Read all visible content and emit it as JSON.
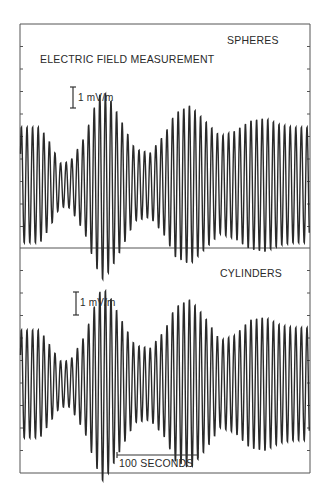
{
  "chart_data": [
    {
      "type": "line",
      "panel": "top",
      "title": "ELECTRIC FIELD MEASUREMENT",
      "label": "SPHERES",
      "scale_bar": "1 mV/m",
      "xlabel": "",
      "ylabel": "",
      "grid": false,
      "carrier_period_px": 5.6,
      "envelope_x_px": [
        20,
        40,
        50,
        60,
        70,
        85,
        95,
        102,
        110,
        120,
        135,
        150,
        165,
        175,
        190,
        205,
        220,
        235,
        250,
        265,
        280,
        295,
        310
      ],
      "envelope_amp_relative": [
        0.45,
        0.45,
        0.33,
        0.17,
        0.18,
        0.38,
        0.62,
        0.74,
        0.67,
        0.52,
        0.28,
        0.25,
        0.4,
        0.56,
        0.62,
        0.5,
        0.38,
        0.42,
        0.5,
        0.52,
        0.47,
        0.45,
        0.45
      ]
    },
    {
      "type": "line",
      "panel": "bottom",
      "label": "CYLINDERS",
      "scale_bar": "1 mV/m",
      "time_scale_bar": "100 SECONDS",
      "xlabel": "",
      "ylabel": "",
      "grid": false,
      "carrier_period_px": 5.6,
      "envelope_x_px": [
        20,
        40,
        50,
        60,
        70,
        85,
        95,
        102,
        110,
        120,
        135,
        150,
        165,
        175,
        190,
        205,
        220,
        235,
        250,
        265,
        280,
        295,
        310
      ],
      "envelope_amp_relative": [
        0.42,
        0.42,
        0.3,
        0.18,
        0.18,
        0.38,
        0.62,
        0.76,
        0.68,
        0.52,
        0.3,
        0.28,
        0.42,
        0.6,
        0.66,
        0.52,
        0.34,
        0.38,
        0.5,
        0.52,
        0.46,
        0.44,
        0.44
      ]
    }
  ],
  "labels": {
    "title": "ELECTRIC FIELD MEASUREMENT",
    "top_panel": "SPHERES",
    "bottom_panel": "CYLINDERS",
    "top_scale": "1 mV/m",
    "bottom_scale": "1 mV/m",
    "time_scale": "100 SECONDS"
  },
  "colors": {
    "ink": "#2a2a2a",
    "frame": "#555555",
    "background": "#ffffff"
  }
}
